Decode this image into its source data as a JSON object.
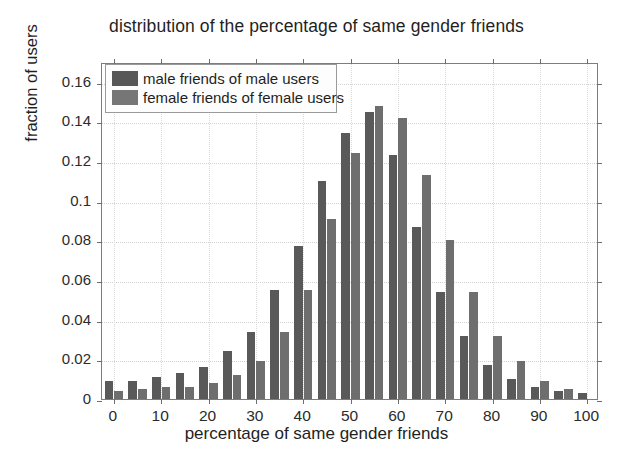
{
  "chart_data": {
    "type": "bar",
    "title": "distribution of the percentage of same gender friends",
    "xlabel": "percentage of same gender friends",
    "ylabel": "fraction of users",
    "xlim": [
      -2.5,
      102.5
    ],
    "ylim": [
      0,
      0.17
    ],
    "grid": true,
    "legend_position": "top-left",
    "x_ticks": [
      0,
      10,
      20,
      30,
      40,
      50,
      60,
      70,
      80,
      90,
      100
    ],
    "x_tick_labels": [
      "0",
      "10",
      "20",
      "30",
      "40",
      "50",
      "60",
      "70",
      "80",
      "90",
      "100"
    ],
    "y_ticks": [
      0,
      0.02,
      0.04,
      0.06,
      0.08,
      0.1,
      0.12,
      0.14,
      0.16
    ],
    "y_tick_labels": [
      "0",
      "0.02",
      "0.04",
      "0.06",
      "0.08",
      "0.1",
      "0.12",
      "0.14",
      "0.16"
    ],
    "categories": [
      0,
      5,
      10,
      15,
      20,
      25,
      30,
      35,
      40,
      45,
      50,
      55,
      60,
      65,
      70,
      75,
      80,
      85,
      90,
      95,
      100
    ],
    "series": [
      {
        "name": "male friends of male users",
        "color": "#595959",
        "values": [
          0.009,
          0.009,
          0.011,
          0.013,
          0.016,
          0.024,
          0.034,
          0.055,
          0.077,
          0.11,
          0.134,
          0.145,
          0.123,
          0.087,
          0.054,
          0.032,
          0.017,
          0.01,
          0.006,
          0.004,
          0.003
        ]
      },
      {
        "name": "female friends of female users",
        "color": "#6e6e6e",
        "values": [
          0.004,
          0.005,
          0.006,
          0.006,
          0.008,
          0.012,
          0.019,
          0.034,
          0.055,
          0.091,
          0.124,
          0.148,
          0.142,
          0.113,
          0.08,
          0.054,
          0.032,
          0.019,
          0.009,
          0.005,
          0.0
        ]
      }
    ]
  },
  "legend": {
    "items": [
      {
        "label": "male friends of male users"
      },
      {
        "label": "female friends of female users"
      }
    ]
  }
}
